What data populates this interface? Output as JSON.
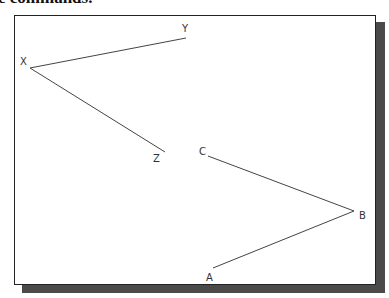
{
  "heading": {
    "text": "e commands."
  },
  "diagram": {
    "points": [
      {
        "label": "X",
        "x": 30,
        "y": 68,
        "lx": 20,
        "ly": 65
      },
      {
        "label": "Y",
        "x": 186,
        "y": 38,
        "lx": 182,
        "ly": 32
      },
      {
        "label": "Z",
        "x": 165,
        "y": 152,
        "lx": 153,
        "ly": 162
      },
      {
        "label": "C",
        "x": 208,
        "y": 156,
        "lx": 199,
        "ly": 155
      },
      {
        "label": "B",
        "x": 354,
        "y": 211,
        "lx": 359,
        "ly": 219
      },
      {
        "label": "A",
        "x": 213,
        "y": 268,
        "lx": 206,
        "ly": 281
      }
    ],
    "segments": [
      [
        "X",
        "Y"
      ],
      [
        "X",
        "Z"
      ],
      [
        "C",
        "B"
      ],
      [
        "B",
        "A"
      ]
    ]
  }
}
